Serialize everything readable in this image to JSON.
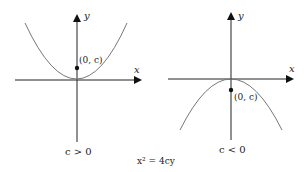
{
  "figure": {
    "equation": "x² = 4cy",
    "left_panel": {
      "x_label": "x",
      "y_label": "y",
      "point_label": "(0, c)",
      "condition": "c > 0",
      "opens": "up"
    },
    "right_panel": {
      "x_label": "x",
      "y_label": "y",
      "point_label": "(0, c)",
      "condition": "c < 0",
      "opens": "down"
    },
    "colors": {
      "axis": "#222222",
      "curve": "#777777",
      "point": "#111111"
    }
  }
}
